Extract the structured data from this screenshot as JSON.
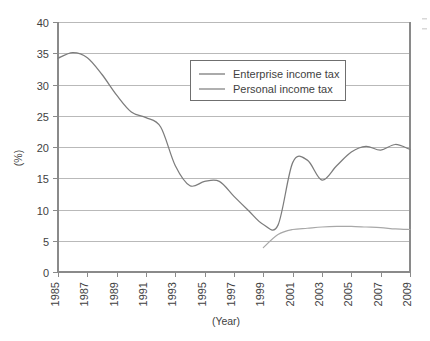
{
  "chart_data": {
    "type": "line",
    "title": "",
    "xlabel": "(Year)",
    "ylabel": "(%)",
    "xlim": [
      1985,
      2009
    ],
    "ylim": [
      0,
      40
    ],
    "ytick_step": 5,
    "xtick_step": 2,
    "grid": "horizontal",
    "legend_position": "top-center",
    "xticks": [
      "1985",
      "1987",
      "1989",
      "1991",
      "1993",
      "1995",
      "1997",
      "1999",
      "2001",
      "2003",
      "2005",
      "2007",
      "2009"
    ],
    "yticks": [
      "0",
      "5",
      "10",
      "15",
      "20",
      "25",
      "30",
      "35",
      "40"
    ],
    "x": [
      1985,
      1986,
      1987,
      1988,
      1989,
      1990,
      1991,
      1992,
      1993,
      1994,
      1995,
      1996,
      1997,
      1998,
      1999,
      2000,
      2001,
      2002,
      2003,
      2004,
      2005,
      2006,
      2007,
      2008,
      2009
    ],
    "series": [
      {
        "name": "Enterprise income tax",
        "color": "#7c7c7c",
        "values": [
          34.2,
          35.1,
          34.3,
          31.6,
          28.3,
          25.6,
          24.7,
          23.2,
          17.0,
          13.8,
          14.5,
          14.5,
          12.1,
          9.8,
          7.6,
          7.5,
          17.5,
          17.9,
          14.7,
          17.0,
          19.2,
          20.1,
          19.5,
          20.4,
          19.6
        ]
      },
      {
        "name": "Personal income tax",
        "color": "#a8a8a8",
        "values": [
          null,
          null,
          null,
          null,
          null,
          null,
          null,
          null,
          null,
          null,
          null,
          null,
          null,
          null,
          3.9,
          6.0,
          6.8,
          7.0,
          7.2,
          7.3,
          7.3,
          7.2,
          7.1,
          6.9,
          6.8
        ]
      }
    ]
  },
  "legend": {
    "entries": [
      {
        "label": "Enterprise income tax"
      },
      {
        "label": "Personal income tax"
      }
    ]
  },
  "axes": {
    "y_axis_title": "(%)",
    "x_axis_title": "(Year)"
  }
}
